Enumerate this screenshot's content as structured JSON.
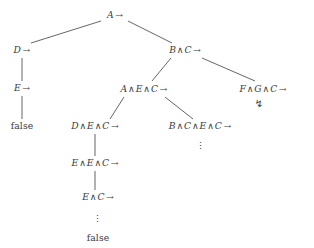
{
  "diagram": {
    "background_color": "#ffffff",
    "text_color": "#3b3b3b",
    "edge_color": "#4a4a4a",
    "symbols": {
      "conjunction": "∧",
      "implication_arrow": "→",
      "contradiction_bolt": "↯",
      "vertical_dots": "⋮"
    },
    "nodes": [
      {
        "id": "root",
        "label": "A →",
        "parts": [
          {
            "t": "A",
            "k": "v"
          },
          {
            "t": "→",
            "k": "arrow"
          }
        ],
        "x": 115,
        "y": 15
      },
      {
        "id": "d-arrow",
        "label": "D →",
        "parts": [
          {
            "t": "D",
            "k": "v"
          },
          {
            "t": "→",
            "k": "arrow"
          }
        ],
        "x": 22,
        "y": 50
      },
      {
        "id": "e-arrow",
        "label": "E →",
        "parts": [
          {
            "t": "E",
            "k": "v"
          },
          {
            "t": "→",
            "k": "arrow"
          }
        ],
        "x": 22,
        "y": 88
      },
      {
        "id": "false-left",
        "label": "false",
        "parts": [
          {
            "t": "false",
            "k": "roman"
          }
        ],
        "x": 22,
        "y": 126
      },
      {
        "id": "b-and-c",
        "label": "B ∧ C →",
        "parts": [
          {
            "t": "B",
            "k": "v"
          },
          {
            "t": "∧",
            "k": "op"
          },
          {
            "t": "C",
            "k": "v"
          },
          {
            "t": "→",
            "k": "arrow"
          }
        ],
        "x": 185,
        "y": 50
      },
      {
        "id": "a-e-c",
        "label": "A ∧ E ∧ C →",
        "parts": [
          {
            "t": "A",
            "k": "v"
          },
          {
            "t": "∧",
            "k": "op"
          },
          {
            "t": "E",
            "k": "v"
          },
          {
            "t": "∧",
            "k": "op"
          },
          {
            "t": "C",
            "k": "v"
          },
          {
            "t": "→",
            "k": "arrow"
          }
        ],
        "x": 144,
        "y": 89
      },
      {
        "id": "f-g-c",
        "label": "F ∧ G ∧ C →",
        "parts": [
          {
            "t": "F",
            "k": "v"
          },
          {
            "t": "∧",
            "k": "op"
          },
          {
            "t": "G",
            "k": "v"
          },
          {
            "t": "∧",
            "k": "op"
          },
          {
            "t": "C",
            "k": "v"
          },
          {
            "t": "→",
            "k": "arrow"
          }
        ],
        "x": 263,
        "y": 89
      },
      {
        "id": "d-e-c",
        "label": "D ∧ E ∧ C →",
        "parts": [
          {
            "t": "D",
            "k": "v"
          },
          {
            "t": "∧",
            "k": "op"
          },
          {
            "t": "E",
            "k": "v"
          },
          {
            "t": "∧",
            "k": "op"
          },
          {
            "t": "C",
            "k": "v"
          },
          {
            "t": "→",
            "k": "arrow"
          }
        ],
        "x": 95,
        "y": 126
      },
      {
        "id": "b-c-e-c",
        "label": "B ∧ C ∧ E ∧ C →",
        "parts": [
          {
            "t": "B",
            "k": "v"
          },
          {
            "t": "∧",
            "k": "op"
          },
          {
            "t": "C",
            "k": "v"
          },
          {
            "t": "∧",
            "k": "op"
          },
          {
            "t": "E",
            "k": "v"
          },
          {
            "t": "∧",
            "k": "op"
          },
          {
            "t": "C",
            "k": "v"
          },
          {
            "t": "→",
            "k": "arrow"
          }
        ],
        "x": 200,
        "y": 126
      },
      {
        "id": "e-e-c",
        "label": "E ∧ E ∧ C →",
        "parts": [
          {
            "t": "E",
            "k": "v"
          },
          {
            "t": "∧",
            "k": "op"
          },
          {
            "t": "E",
            "k": "v"
          },
          {
            "t": "∧",
            "k": "op"
          },
          {
            "t": "C",
            "k": "v"
          },
          {
            "t": "→",
            "k": "arrow"
          }
        ],
        "x": 95,
        "y": 163
      },
      {
        "id": "e-c",
        "label": "E ∧ C →",
        "parts": [
          {
            "t": "E",
            "k": "v"
          },
          {
            "t": "∧",
            "k": "op"
          },
          {
            "t": "C",
            "k": "v"
          },
          {
            "t": "→",
            "k": "arrow"
          }
        ],
        "x": 98,
        "y": 197
      },
      {
        "id": "false-bottom",
        "label": "false",
        "parts": [
          {
            "t": "false",
            "k": "roman"
          }
        ],
        "x": 98,
        "y": 238
      }
    ],
    "markers": [
      {
        "id": "bolt-f-g-c",
        "glyph": "↯",
        "x": 259,
        "y": 104,
        "name": "contradiction-bolt-icon"
      },
      {
        "id": "dots-b-c-e-c",
        "glyph": "⋮",
        "x": 200,
        "y": 146,
        "name": "vertical-dots-b-c-e-c"
      },
      {
        "id": "dots-e-c",
        "glyph": "⋮",
        "x": 97,
        "y": 219,
        "name": "vertical-dots-e-c"
      }
    ],
    "edges": [
      {
        "from": "root",
        "to": "d-arrow",
        "x1": 101,
        "y1": 21,
        "x2": 31,
        "y2": 43,
        "kind": "diagonal"
      },
      {
        "from": "root",
        "to": "b-and-c",
        "x1": 128,
        "y1": 21,
        "x2": 172,
        "y2": 43,
        "kind": "diagonal"
      },
      {
        "from": "d-arrow",
        "to": "e-arrow",
        "x1": 22,
        "y1": 58,
        "x2": 22,
        "y2": 81,
        "kind": "vertical"
      },
      {
        "from": "e-arrow",
        "to": "false-left",
        "x1": 22,
        "y1": 96,
        "x2": 22,
        "y2": 119,
        "kind": "vertical"
      },
      {
        "from": "b-and-c",
        "to": "a-e-c",
        "x1": 171,
        "y1": 58,
        "x2": 152,
        "y2": 81,
        "kind": "diagonal"
      },
      {
        "from": "b-and-c",
        "to": "f-g-c",
        "x1": 202,
        "y1": 58,
        "x2": 255,
        "y2": 81,
        "kind": "diagonal"
      },
      {
        "from": "a-e-c",
        "to": "d-e-c",
        "x1": 124,
        "y1": 97,
        "x2": 110,
        "y2": 119,
        "kind": "diagonal"
      },
      {
        "from": "a-e-c",
        "to": "b-c-e-c",
        "x1": 165,
        "y1": 97,
        "x2": 193,
        "y2": 119,
        "kind": "diagonal"
      },
      {
        "from": "d-e-c",
        "to": "e-e-c",
        "x1": 95,
        "y1": 134,
        "x2": 95,
        "y2": 156,
        "kind": "vertical"
      },
      {
        "from": "e-e-c",
        "to": "e-c",
        "x1": 95,
        "y1": 171,
        "x2": 95,
        "y2": 190,
        "kind": "vertical"
      }
    ]
  }
}
